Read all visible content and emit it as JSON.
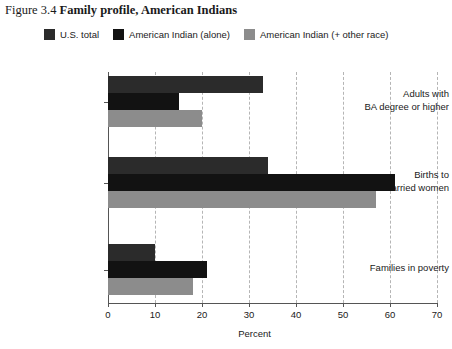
{
  "figure": {
    "number": "Figure 3.4",
    "title": "Family profile, American Indians"
  },
  "chart_data": {
    "type": "bar",
    "orientation": "horizontal",
    "title": "Family profile, American Indians",
    "xlabel": "Percent",
    "ylabel": "",
    "xlim": [
      0,
      70
    ],
    "xticks": [
      0,
      10,
      20,
      30,
      40,
      50,
      60,
      70
    ],
    "xtick_labels": [
      "0",
      "10",
      "20",
      "30",
      "40",
      "50",
      "60",
      "70"
    ],
    "grid": "vertical-dashed",
    "legend_position": "top",
    "categories": [
      "Adults with BA degree or higher",
      "Births to unmarried women",
      "Families in poverty"
    ],
    "category_lines": [
      [
        "Adults with",
        "BA degree or higher"
      ],
      [
        "Births to",
        "unmarried women"
      ],
      [
        "Families in poverty"
      ]
    ],
    "series": [
      {
        "name": "U.S. total",
        "color": "#2b2b2b",
        "values": [
          33,
          34,
          10
        ]
      },
      {
        "name": "American Indian (alone)",
        "color": "#121212",
        "values": [
          15,
          61,
          21
        ]
      },
      {
        "name": "American Indian (+ other race)",
        "color": "#8c8c8c",
        "values": [
          20,
          57,
          18
        ]
      }
    ]
  },
  "colors": {
    "axis": "#555555",
    "grid": "#b5b5b5",
    "background": "#ffffff",
    "text": "#1a1a1a"
  }
}
